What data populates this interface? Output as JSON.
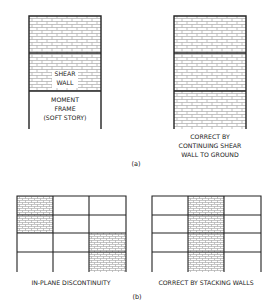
{
  "figure": {
    "panel_a": {
      "caption": "(a)",
      "left_building": {
        "stories": [
          "shear-wall",
          "shear-wall",
          "moment-frame"
        ],
        "label_shear_line1": "SHEAR",
        "label_shear_line2": "WALL",
        "label_frame_line1": "MOMENT",
        "label_frame_line2": "FRAME",
        "label_frame_line3": "(SOFT STORY)"
      },
      "right_building": {
        "stories": [
          "shear-wall",
          "shear-wall",
          "shear-wall"
        ],
        "caption_line1": "CORRECT BY",
        "caption_line2": "CONTINUING SHEAR",
        "caption_line3": "WALL TO GROUND"
      }
    },
    "panel_b": {
      "caption": "(b)",
      "left_grid": {
        "caption": "IN-PLANE DISCONTINUITY",
        "shaded_cells": [
          [
            0,
            0
          ],
          [
            1,
            0
          ],
          [
            2,
            2
          ],
          [
            3,
            2
          ]
        ]
      },
      "right_grid": {
        "caption": "CORRECT BY STACKING WALLS",
        "shaded_cells": [
          [
            0,
            1
          ],
          [
            1,
            1
          ],
          [
            2,
            1
          ],
          [
            3,
            1
          ]
        ]
      }
    },
    "colors": {
      "line": "#222222",
      "brick": "#9a9a9a",
      "background": "#ffffff"
    }
  }
}
